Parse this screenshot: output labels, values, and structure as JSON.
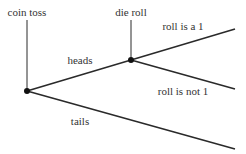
{
  "diagram": {
    "type": "probability-tree",
    "colors": {
      "line": "#2a2a2a",
      "node": "#111111",
      "text": "#333333",
      "background": "#ffffff"
    },
    "nodes": [
      {
        "id": "coin",
        "label": "coin toss",
        "x": 27,
        "y": 91
      },
      {
        "id": "die",
        "label": "die roll",
        "x": 131,
        "y": 60
      }
    ],
    "edges": [
      {
        "id": "heads",
        "label": "heads",
        "from": [
          27,
          91
        ],
        "to": [
          131,
          60
        ],
        "label_pos": [
          80,
          62
        ]
      },
      {
        "id": "tails",
        "label": "tails",
        "from": [
          27,
          91
        ],
        "to": [
          235,
          149
        ],
        "label_pos": [
          80,
          124
        ]
      },
      {
        "id": "roll-is-1",
        "label": "roll is a 1",
        "from": [
          131,
          60
        ],
        "to": [
          235,
          29
        ],
        "label_pos": [
          183,
          29
        ]
      },
      {
        "id": "roll-not-1",
        "label": "roll is not 1",
        "from": [
          131,
          60
        ],
        "to": [
          235,
          89
        ],
        "label_pos": [
          183,
          95
        ]
      }
    ]
  },
  "labels": {
    "coin_toss": "coin toss",
    "die_roll": "die roll",
    "heads": "heads",
    "tails": "tails",
    "roll_is_1": "roll is a 1",
    "roll_not_1": "roll is not 1"
  }
}
